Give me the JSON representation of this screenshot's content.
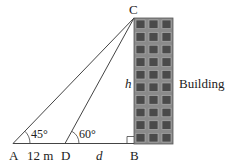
{
  "diagram": {
    "points": {
      "A": "A",
      "B": "B",
      "C": "C",
      "D": "D"
    },
    "angles": {
      "at_A": "45°",
      "at_D": "60°"
    },
    "lengths": {
      "AD": "12 m",
      "DB": "d",
      "BC": "h"
    },
    "labels": {
      "building": "Building"
    },
    "building": {
      "rows": 10,
      "columns": 3,
      "wall_color": "#8a8a8a",
      "window_color": "#4a4a4a"
    },
    "line_color": "#444444"
  }
}
